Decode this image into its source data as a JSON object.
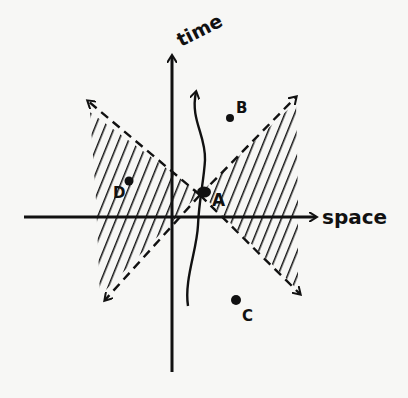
{
  "diagram": {
    "type": "spacetime-diagram",
    "axes": {
      "x_label": "space",
      "y_label": "time"
    },
    "events": [
      {
        "id": "A",
        "label": "A",
        "x": 204,
        "y": 192
      },
      {
        "id": "B",
        "label": "B",
        "x": 230,
        "y": 118
      },
      {
        "id": "C",
        "label": "C",
        "x": 236,
        "y": 300
      },
      {
        "id": "D",
        "label": "D",
        "x": 129,
        "y": 181
      }
    ],
    "regions": {
      "hatched": "spacelike regions (left and right wedges)"
    },
    "colors": {
      "ink": "#111111",
      "background": "#f7f7f5"
    }
  }
}
